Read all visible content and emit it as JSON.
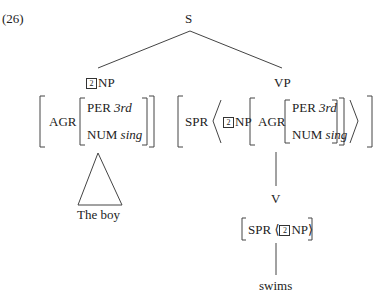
{
  "example_number": "(26)",
  "tree": {
    "root": "S",
    "np": {
      "tag": "2",
      "label": "NP",
      "avm": {
        "feature": "AGR",
        "per_label": "PER",
        "per_value": "3rd",
        "num_label": "NUM",
        "num_value": "sing"
      },
      "terminal": "The boy"
    },
    "vp": {
      "label": "VP",
      "avm": {
        "spr_label": "SPR",
        "tag": "2",
        "np_label": "NP",
        "feature": "AGR",
        "per_label": "PER",
        "per_value": "3rd",
        "num_label": "NUM",
        "num_value": "sing"
      },
      "v": {
        "label": "V",
        "avm": {
          "spr_label": "SPR",
          "tag": "2",
          "np_label": "NP"
        },
        "terminal": "swims"
      }
    }
  }
}
